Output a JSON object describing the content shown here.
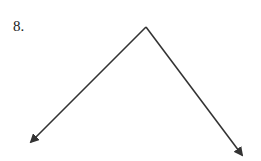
{
  "problem": {
    "number_label": "8."
  },
  "figure": {
    "type": "angle",
    "vertex": [
      146,
      27
    ],
    "rays": [
      {
        "name": "left-ray",
        "end": [
          31,
          142
        ]
      },
      {
        "name": "right-ray",
        "end": [
          242,
          155
        ]
      }
    ],
    "stroke_color": "#333333"
  }
}
